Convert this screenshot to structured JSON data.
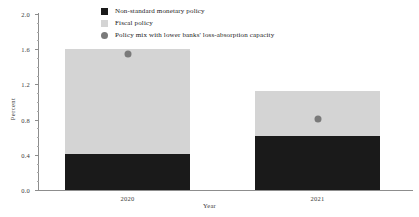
{
  "chart_data": {
    "type": "bar",
    "stacked": true,
    "title": "",
    "xlabel": "Year",
    "ylabel": "Percent",
    "categories": [
      "2020",
      "2021"
    ],
    "ylim": [
      0.0,
      2.0
    ],
    "ytick_labels": [
      "0.0",
      "0.4",
      "0.8",
      "1.2",
      "1.6",
      "2.0"
    ],
    "ytick_values": [
      0.0,
      0.4,
      0.8,
      1.2,
      1.6,
      2.0
    ],
    "yminor_step": 0.1,
    "grid": false,
    "legend_position": "top-center",
    "series": [
      {
        "name": "Non-standard monetary policy",
        "marker": "square",
        "color": "#1a1a1a",
        "values": [
          0.41,
          0.61
        ]
      },
      {
        "name": "Fiscal policy",
        "marker": "square",
        "color": "#d4d4d4",
        "values": [
          1.19,
          0.51
        ]
      },
      {
        "name": "Policy mix with lower banks' loss-absorption capacity",
        "marker": "circle",
        "color": "#7a7a7a",
        "values": [
          1.54,
          0.81
        ]
      }
    ],
    "stack_totals": [
      1.6,
      1.12
    ]
  }
}
